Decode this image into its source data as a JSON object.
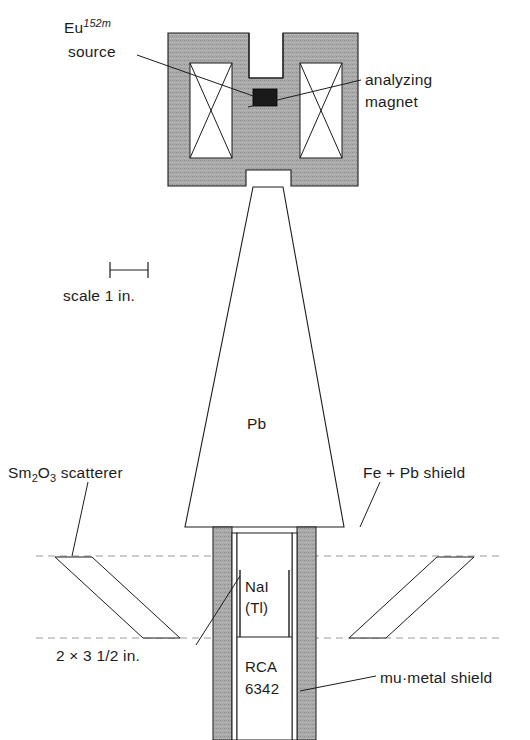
{
  "figure": {
    "background_color": "#ffffff",
    "line_color": "#1c1c1c",
    "hatch_fill_color": "#a8a8a8",
    "source_block_color": "#1a1a1a",
    "dashed_line_color": "#9a9a9a"
  },
  "labels": {
    "source_isotope_element": "Eu",
    "source_isotope_mass": "152m",
    "source_word": "source",
    "analyzing_magnet_line1": "analyzing",
    "analyzing_magnet_line2": "magnet",
    "scale": "scale 1 in.",
    "collimator_material": "Pb",
    "scatterer_prefix": "Sm",
    "scatterer_sub1": "2",
    "scatterer_mid": "O",
    "scatterer_sub2": "3",
    "scatterer_suffix": " scatterer",
    "shield": "Fe + Pb shield",
    "crystal_line1": "NaI",
    "crystal_line2": "(Tl)",
    "crystal_dimensions": "2 × 3 1/2 in.",
    "pmt_line1": "RCA",
    "pmt_line2": "6342",
    "mu_metal_shield": "mu·metal shield"
  },
  "components": [
    {
      "name": "analyzing-magnet",
      "material": "iron yoke with coils",
      "label": "analyzing magnet"
    },
    {
      "name": "eu-source",
      "material": "Eu 152m",
      "label": "Eu 152m source"
    },
    {
      "name": "magnet-coil-left",
      "material": "wire winding",
      "label": "coil"
    },
    {
      "name": "magnet-coil-right",
      "material": "wire winding",
      "label": "coil"
    },
    {
      "name": "lead-collimator",
      "material": "Pb",
      "label": "Pb"
    },
    {
      "name": "sm2o3-scatterer-left",
      "material": "Sm2O3",
      "label": "Sm2O3 scatterer"
    },
    {
      "name": "sm2o3-scatterer-right",
      "material": "Sm2O3",
      "label": "Sm2O3 scatterer"
    },
    {
      "name": "fe-pb-shield",
      "material": "Fe + Pb",
      "label": "Fe + Pb shield"
    },
    {
      "name": "mu-metal-shield",
      "material": "mu-metal",
      "label": "mu·metal shield"
    },
    {
      "name": "nai-crystal",
      "material": "NaI(Tl)",
      "label": "NaI (Tl)",
      "dimensions": "2 × 3 1/2 in."
    },
    {
      "name": "photomultiplier",
      "material": "RCA 6342",
      "label": "RCA 6342"
    },
    {
      "name": "scale-bar",
      "label": "scale 1 in."
    }
  ]
}
